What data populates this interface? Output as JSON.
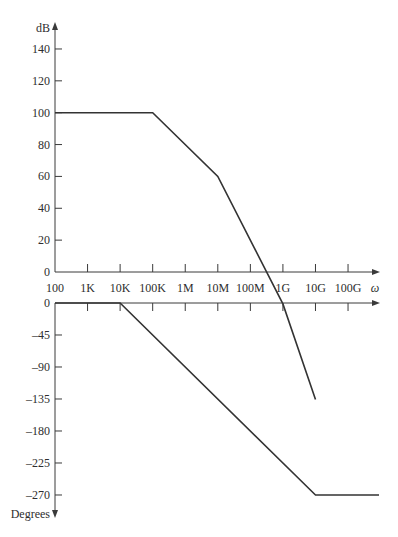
{
  "chart_data": [
    {
      "type": "line",
      "title": "",
      "name": "magnitude",
      "xlabel": "ω",
      "ylabel": "dB",
      "xscale": "log",
      "x_ticks": [
        100,
        1000,
        10000,
        100000,
        1000000,
        10000000,
        100000000,
        1000000000,
        10000000000,
        100000000000
      ],
      "x_tick_labels": [
        "100",
        "1K",
        "10K",
        "100K",
        "1M",
        "10M",
        "100M",
        "1G",
        "10G",
        "100G"
      ],
      "y_ticks": [
        0,
        20,
        40,
        60,
        80,
        100,
        120,
        140
      ],
      "y_tick_labels": [
        "0",
        "20",
        "40",
        "60",
        "80",
        "100",
        "120",
        "140"
      ],
      "ylim": [
        0,
        150
      ],
      "grid": false,
      "series": [
        {
          "name": "Magnitude (asymptotic)",
          "x": [
            100,
            100000,
            10000000,
            1000000000,
            10000000000
          ],
          "values": [
            100,
            100,
            60,
            -20,
            -80
          ]
        }
      ]
    },
    {
      "type": "line",
      "title": "",
      "name": "phase",
      "xlabel": "ω",
      "ylabel": "Degrees",
      "xscale": "log",
      "x_ticks": [
        100,
        1000,
        10000,
        100000,
        1000000,
        10000000,
        100000000,
        1000000000,
        10000000000,
        100000000000
      ],
      "y_ticks": [
        0,
        -45,
        -90,
        -135,
        -180,
        -225,
        -270
      ],
      "y_tick_labels": [
        "0",
        "–45",
        "–90",
        "–135",
        "–180",
        "–225",
        "–270"
      ],
      "ylim": [
        -280,
        0
      ],
      "grid": false,
      "series": [
        {
          "name": "Phase (asymptotic)",
          "x": [
            100,
            10000,
            10000000000,
            1000000000000
          ],
          "values": [
            0,
            0,
            -270,
            -270
          ]
        }
      ]
    }
  ],
  "labels": {
    "db_axis": "dB",
    "degrees_axis": "Degrees",
    "omega": "ω"
  },
  "colors": {
    "line": "#333333",
    "axis": "#3a3a3a",
    "text": "#2e2e2e"
  }
}
